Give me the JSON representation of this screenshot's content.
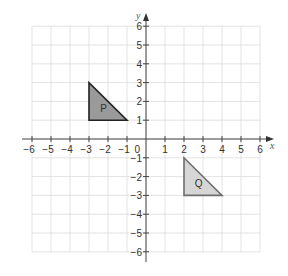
{
  "diagram": {
    "type": "coordinate-grid",
    "axes": {
      "x_label": "x",
      "y_label": "y",
      "x_range": [
        -6,
        6
      ],
      "y_range": [
        -6,
        6
      ],
      "origin_label": "0",
      "x_ticks": [
        "-6",
        "-5",
        "-4",
        "-3",
        "-2",
        "-1",
        "1",
        "2",
        "3",
        "4",
        "5",
        "6"
      ],
      "y_ticks": [
        "6",
        "5",
        "4",
        "3",
        "2",
        "1",
        "-1",
        "-2",
        "-3",
        "-4",
        "-5",
        "-6"
      ]
    },
    "grid": {
      "visible": true,
      "color": "#dcdcdc"
    },
    "shapes": [
      {
        "label": "P",
        "vertices": [
          [
            -3,
            3
          ],
          [
            -3,
            1
          ],
          [
            -1,
            1
          ]
        ],
        "fill": "#9a9a9a",
        "stroke": "#222222"
      },
      {
        "label": "Q",
        "vertices": [
          [
            2,
            -1
          ],
          [
            2,
            -3
          ],
          [
            4,
            -3
          ]
        ],
        "fill": "#d6d6d6",
        "stroke": "#6e6e6e"
      }
    ]
  }
}
